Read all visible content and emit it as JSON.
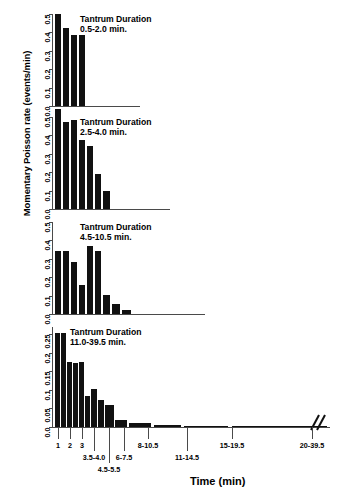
{
  "chart_data": {
    "type": "bar",
    "title": "",
    "xlabel": "Time (min)",
    "ylabel": "Momentary Poisson rate (events/min)",
    "grid": false,
    "legend": "none",
    "panels": [
      {
        "label": "Tantrum Duration\n0.5-2.0 min.",
        "title_line1": "Tantrum Duration",
        "title_line2": "0.5-2.0 min.",
        "ylim": [
          0,
          0.5
        ],
        "yticks": [
          "0.0",
          "0.1",
          "0.2",
          "0.3",
          "0.4",
          "0.5"
        ],
        "ytickvals": [
          0.0,
          0.1,
          0.2,
          0.3,
          0.4,
          0.5
        ],
        "categories": [
          "1",
          "2",
          "3",
          "3.5-4.0"
        ],
        "values": [
          0.5,
          0.425,
          0.385,
          0.385
        ]
      },
      {
        "label": "Tantrum Duration\n2.5-4.0 min.",
        "title_line1": "Tantrum Duration",
        "title_line2": "2.5-4.0 min.",
        "ylim": [
          0,
          0.5
        ],
        "yticks": [
          "0.0",
          "0.1",
          "0.2",
          "0.3",
          "0.4",
          "0.5"
        ],
        "ytickvals": [
          0.0,
          0.1,
          0.2,
          0.3,
          0.4,
          0.5
        ],
        "categories": [
          "1",
          "2",
          "3",
          "3.5-4.0",
          "4.5-5.5",
          "6-7.5",
          "8-10.5"
        ],
        "values": [
          0.545,
          0.475,
          0.485,
          0.375,
          0.345,
          0.19,
          0.1
        ]
      },
      {
        "label": "Tantrum Duration\n4.5-10.5 min.",
        "title_line1": "Tantrum Duration",
        "title_line2": "4.5-10.5 min.",
        "ylim": [
          0,
          0.5
        ],
        "yticks": [
          "0.0",
          "0.1",
          "0.2",
          "0.3",
          "0.4",
          "0.5"
        ],
        "ytickvals": [
          0.0,
          0.1,
          0.2,
          0.3,
          0.4,
          0.5
        ],
        "categories": [
          "1",
          "2",
          "3",
          "3.5-4.0",
          "4.5-5.5",
          "6-7.5",
          "8-10.5",
          "11-14.5",
          "15-19.5"
        ],
        "values": [
          0.345,
          0.345,
          0.285,
          0.155,
          0.37,
          0.34,
          0.105,
          0.055,
          0.02
        ]
      },
      {
        "label": "Tantrum Duration\n11.0-39.5 min.",
        "title_line1": "Tantrum Duration",
        "title_line2": "11.0-39.5 min.",
        "ylim": [
          0,
          0.27
        ],
        "yticks": [
          "0.0",
          "0.05",
          "0.1",
          "0.15",
          "0.2",
          "0.25"
        ],
        "ytickvals": [
          0.0,
          0.05,
          0.1,
          0.15,
          0.2,
          0.25
        ],
        "categories": [
          "1",
          "2",
          "3",
          "3.5-4.0",
          "4.5-5.5",
          "6-7.5",
          "8-10.5",
          "11-14.5",
          "15-19.5",
          "20-39.5"
        ],
        "values": [
          0.255,
          0.255,
          0.175,
          0.172,
          0.175,
          0.085,
          0.102,
          0.072,
          0.06,
          0.018,
          0.012,
          0.006,
          0.004,
          0.002
        ]
      }
    ],
    "xaxis_labels": [
      "1",
      "2",
      "3",
      "3.5-4.0",
      "4.5-5.5",
      "6-7.5",
      "8-10.5",
      "11-14.5",
      "15-19.5",
      "20-39.5"
    ],
    "axis_break": true
  }
}
